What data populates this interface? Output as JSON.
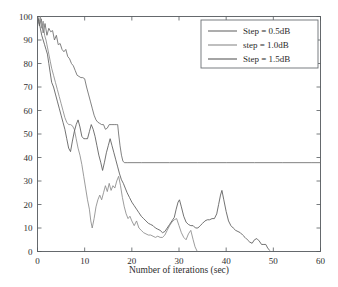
{
  "figure": {
    "background": "#ffffff",
    "width": 338,
    "height": 287
  },
  "axes": {
    "x_label": "Number of iterations (sec)",
    "y_label": "",
    "x_ticks": [
      "0",
      "10",
      "20",
      "30",
      "40",
      "50",
      "60"
    ],
    "y_ticks": [
      "0",
      "10",
      "20",
      "30",
      "40",
      "50",
      "60",
      "70",
      "80",
      "90",
      "100"
    ],
    "frame_color": "#555a5e"
  },
  "legend": {
    "position": "top-right",
    "border_color": "#6a6f73",
    "entries": [
      {
        "label": "Step = 0.5dB",
        "color": "#6b6b6b"
      },
      {
        "label": "step = 1.0dB",
        "color": "#8a8a8a"
      },
      {
        "label": "Step = 1.5dB",
        "color": "#5a5a5a"
      }
    ]
  },
  "chart_data": {
    "type": "line",
    "title": "",
    "xlabel": "Number of iterations (sec)",
    "ylabel": "",
    "xlim": [
      0,
      60
    ],
    "ylim": [
      0,
      100
    ],
    "grid": false,
    "legend_position": "top-right",
    "series": [
      {
        "name": "Step = 0.5dB",
        "color": "#6b6b6b",
        "points": [
          [
            0.0,
            100.0
          ],
          [
            0.4,
            96.0
          ],
          [
            0.8,
            99.0
          ],
          [
            1.2,
            93.0
          ],
          [
            1.6,
            97.0
          ],
          [
            2.0,
            92.0
          ],
          [
            2.4,
            95.0
          ],
          [
            2.8,
            93.5
          ],
          [
            3.2,
            94.0
          ],
          [
            3.6,
            90.0
          ],
          [
            4.0,
            92.0
          ],
          [
            4.4,
            88.0
          ],
          [
            4.8,
            88.5
          ],
          [
            5.2,
            86.0
          ],
          [
            5.6,
            85.0
          ],
          [
            6.0,
            86.0
          ],
          [
            6.4,
            83.0
          ],
          [
            6.8,
            82.0
          ],
          [
            7.2,
            80.0
          ],
          [
            7.6,
            79.0
          ],
          [
            8.0,
            77.0
          ],
          [
            8.4,
            75.0
          ],
          [
            8.8,
            74.5
          ],
          [
            9.2,
            74.0
          ],
          [
            9.6,
            74.0
          ],
          [
            10.0,
            73.5
          ],
          [
            10.4,
            70.0
          ],
          [
            10.8,
            67.0
          ],
          [
            11.2,
            64.0
          ],
          [
            11.6,
            61.0
          ],
          [
            12.0,
            58.0
          ],
          [
            12.4,
            56.0
          ],
          [
            12.8,
            55.0
          ],
          [
            13.2,
            54.5
          ],
          [
            13.6,
            54.0
          ],
          [
            14.0,
            54.0
          ],
          [
            14.4,
            52.0
          ],
          [
            14.8,
            52.5
          ],
          [
            15.2,
            54.0
          ],
          [
            15.6,
            54.0
          ],
          [
            16.0,
            54.0
          ],
          [
            16.4,
            54.0
          ],
          [
            16.8,
            54.0
          ],
          [
            17.0,
            54.0
          ],
          [
            17.2,
            50.0
          ],
          [
            17.5,
            45.0
          ],
          [
            17.8,
            41.0
          ],
          [
            18.1,
            38.5
          ],
          [
            18.4,
            37.8
          ],
          [
            19.0,
            37.8
          ],
          [
            22.0,
            37.8
          ],
          [
            28.0,
            37.8
          ],
          [
            34.0,
            37.8
          ],
          [
            40.0,
            37.8
          ],
          [
            46.0,
            37.8
          ],
          [
            52.0,
            37.8
          ],
          [
            58.0,
            37.8
          ],
          [
            60.0,
            37.8
          ]
        ]
      },
      {
        "name": "step = 1.0dB",
        "color": "#8a8a8a",
        "points": [
          [
            0.0,
            100.0
          ],
          [
            0.3,
            97.0
          ],
          [
            0.6,
            100.0
          ],
          [
            0.9,
            95.0
          ],
          [
            1.2,
            98.0
          ],
          [
            1.5,
            92.0
          ],
          [
            1.8,
            90.0
          ],
          [
            2.1,
            87.0
          ],
          [
            2.4,
            84.0
          ],
          [
            2.7,
            81.0
          ],
          [
            3.0,
            78.0
          ],
          [
            3.4,
            75.0
          ],
          [
            3.8,
            72.0
          ],
          [
            4.2,
            69.0
          ],
          [
            4.6,
            66.0
          ],
          [
            5.0,
            63.0
          ],
          [
            5.4,
            60.0
          ],
          [
            5.8,
            57.0
          ],
          [
            6.2,
            55.0
          ],
          [
            6.6,
            54.0
          ],
          [
            7.0,
            54.0
          ],
          [
            7.4,
            53.5
          ],
          [
            7.8,
            52.0
          ],
          [
            8.2,
            48.0
          ],
          [
            8.6,
            44.0
          ],
          [
            9.0,
            41.0
          ],
          [
            9.4,
            37.0
          ],
          [
            9.8,
            32.0
          ],
          [
            10.2,
            27.0
          ],
          [
            10.6,
            22.0
          ],
          [
            11.0,
            18.0
          ],
          [
            11.3,
            13.0
          ],
          [
            11.6,
            10.0
          ],
          [
            12.0,
            14.0
          ],
          [
            12.4,
            19.0
          ],
          [
            12.8,
            22.0
          ],
          [
            13.2,
            24.0
          ],
          [
            13.6,
            22.0
          ],
          [
            14.0,
            25.0
          ],
          [
            14.4,
            28.0
          ],
          [
            14.8,
            25.5
          ],
          [
            15.2,
            29.0
          ],
          [
            15.6,
            26.0
          ],
          [
            16.0,
            28.0
          ],
          [
            16.4,
            27.0
          ],
          [
            16.8,
            30.0
          ],
          [
            17.2,
            32.0
          ],
          [
            17.6,
            28.0
          ],
          [
            18.0,
            23.0
          ],
          [
            18.4,
            19.0
          ],
          [
            18.8,
            16.0
          ],
          [
            19.2,
            14.0
          ],
          [
            19.6,
            15.0
          ],
          [
            20.0,
            13.0
          ],
          [
            20.5,
            11.0
          ],
          [
            21.0,
            13.0
          ],
          [
            21.5,
            10.0
          ],
          [
            22.0,
            9.0
          ],
          [
            22.5,
            8.0
          ],
          [
            23.0,
            7.5
          ],
          [
            23.5,
            7.0
          ],
          [
            24.0,
            7.0
          ],
          [
            24.5,
            6.5
          ],
          [
            25.0,
            6.0
          ],
          [
            25.5,
            6.5
          ],
          [
            26.0,
            6.0
          ],
          [
            26.5,
            6.0
          ],
          [
            27.0,
            7.0
          ],
          [
            27.5,
            9.0
          ],
          [
            28.0,
            11.0
          ],
          [
            28.5,
            12.5
          ],
          [
            29.0,
            13.5
          ],
          [
            29.5,
            14.0
          ],
          [
            30.0,
            11.0
          ],
          [
            30.5,
            8.0
          ],
          [
            31.0,
            6.0
          ],
          [
            31.5,
            5.0
          ],
          [
            32.0,
            7.5
          ],
          [
            32.5,
            9.0
          ],
          [
            33.0,
            5.0
          ],
          [
            33.4,
            2.0
          ],
          [
            33.8,
            0.3
          ]
        ]
      },
      {
        "name": "Step = 1.5dB",
        "color": "#5a5a5a",
        "points": [
          [
            0.0,
            100.0
          ],
          [
            0.3,
            98.0
          ],
          [
            0.6,
            95.0
          ],
          [
            0.9,
            92.0
          ],
          [
            1.2,
            90.0
          ],
          [
            1.5,
            88.0
          ],
          [
            1.8,
            86.0
          ],
          [
            2.1,
            84.0
          ],
          [
            2.4,
            80.0
          ],
          [
            2.7,
            76.0
          ],
          [
            3.0,
            72.0
          ],
          [
            3.4,
            70.0
          ],
          [
            3.8,
            67.0
          ],
          [
            4.2,
            64.0
          ],
          [
            4.6,
            61.0
          ],
          [
            5.0,
            58.0
          ],
          [
            5.4,
            55.0
          ],
          [
            5.8,
            52.0
          ],
          [
            6.2,
            48.0
          ],
          [
            6.6,
            44.0
          ],
          [
            7.0,
            42.5
          ],
          [
            7.4,
            47.0
          ],
          [
            7.8,
            51.0
          ],
          [
            8.2,
            54.0
          ],
          [
            8.6,
            56.0
          ],
          [
            9.0,
            53.0
          ],
          [
            9.4,
            49.0
          ],
          [
            9.8,
            48.0
          ],
          [
            10.2,
            48.0
          ],
          [
            10.6,
            48.0
          ],
          [
            11.0,
            51.0
          ],
          [
            11.4,
            54.0
          ],
          [
            11.8,
            52.0
          ],
          [
            12.2,
            49.0
          ],
          [
            12.6,
            45.0
          ],
          [
            13.0,
            41.0
          ],
          [
            13.4,
            38.0
          ],
          [
            13.8,
            34.5
          ],
          [
            14.2,
            38.0
          ],
          [
            14.6,
            42.0
          ],
          [
            15.0,
            45.0
          ],
          [
            15.4,
            48.0
          ],
          [
            15.8,
            45.0
          ],
          [
            16.2,
            42.0
          ],
          [
            16.6,
            39.0
          ],
          [
            17.0,
            36.0
          ],
          [
            17.4,
            33.0
          ],
          [
            17.8,
            30.5
          ],
          [
            18.2,
            29.0
          ],
          [
            18.6,
            27.0
          ],
          [
            19.0,
            25.0
          ],
          [
            19.5,
            23.0
          ],
          [
            20.0,
            21.0
          ],
          [
            20.5,
            19.5
          ],
          [
            21.0,
            18.0
          ],
          [
            21.5,
            16.5
          ],
          [
            22.0,
            15.0
          ],
          [
            22.5,
            14.0
          ],
          [
            23.0,
            13.0
          ],
          [
            23.5,
            12.0
          ],
          [
            24.0,
            11.5
          ],
          [
            24.5,
            11.0
          ],
          [
            25.0,
            10.0
          ],
          [
            25.5,
            9.5
          ],
          [
            26.0,
            9.0
          ],
          [
            26.5,
            8.0
          ],
          [
            27.0,
            8.5
          ],
          [
            27.5,
            10.0
          ],
          [
            28.0,
            11.5
          ],
          [
            28.5,
            13.0
          ],
          [
            29.0,
            14.5
          ],
          [
            29.4,
            18.0
          ],
          [
            29.8,
            21.0
          ],
          [
            30.1,
            22.0
          ],
          [
            30.5,
            19.0
          ],
          [
            31.0,
            15.0
          ],
          [
            31.5,
            12.5
          ],
          [
            32.0,
            11.5
          ],
          [
            32.5,
            11.0
          ],
          [
            33.0,
            11.0
          ],
          [
            33.5,
            10.0
          ],
          [
            34.0,
            10.0
          ],
          [
            34.5,
            11.0
          ],
          [
            35.0,
            12.0
          ],
          [
            35.5,
            13.0
          ],
          [
            36.0,
            13.5
          ],
          [
            36.5,
            13.5
          ],
          [
            37.0,
            14.0
          ],
          [
            37.5,
            14.0
          ],
          [
            38.0,
            16.0
          ],
          [
            38.4,
            20.0
          ],
          [
            38.8,
            24.0
          ],
          [
            39.1,
            26.0
          ],
          [
            39.5,
            22.0
          ],
          [
            40.0,
            17.0
          ],
          [
            40.5,
            13.0
          ],
          [
            41.0,
            11.0
          ],
          [
            41.5,
            10.0
          ],
          [
            42.0,
            9.0
          ],
          [
            42.5,
            8.5
          ],
          [
            43.0,
            8.0
          ],
          [
            43.5,
            7.0
          ],
          [
            44.0,
            6.0
          ],
          [
            44.5,
            5.0
          ],
          [
            45.0,
            4.0
          ],
          [
            45.5,
            3.5
          ],
          [
            46.0,
            5.0
          ],
          [
            46.5,
            5.5
          ],
          [
            47.0,
            4.5
          ],
          [
            47.5,
            3.0
          ],
          [
            48.0,
            3.0
          ],
          [
            48.4,
            3.0
          ],
          [
            48.8,
            1.5
          ],
          [
            49.2,
            0.5
          ]
        ]
      }
    ]
  }
}
